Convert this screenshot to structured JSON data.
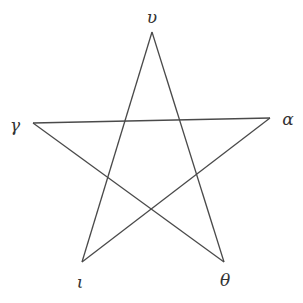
{
  "diagram": {
    "type": "pentagram",
    "nodes": [
      {
        "id": "upsilon",
        "label": "υ",
        "x": 152,
        "y": 32,
        "lx": 152,
        "ly": 23
      },
      {
        "id": "gamma",
        "label": "γ",
        "x": 33,
        "y": 123,
        "lx": 15,
        "ly": 131
      },
      {
        "id": "alpha",
        "label": "α",
        "x": 270,
        "y": 118,
        "lx": 288,
        "ly": 125
      },
      {
        "id": "iota",
        "label": "ι",
        "x": 82,
        "y": 262,
        "lx": 80,
        "ly": 288
      },
      {
        "id": "theta",
        "label": "θ",
        "x": 224,
        "y": 262,
        "lx": 225,
        "ly": 286
      }
    ],
    "edges": [
      [
        "upsilon",
        "iota"
      ],
      [
        "upsilon",
        "theta"
      ],
      [
        "gamma",
        "alpha"
      ],
      [
        "gamma",
        "theta"
      ],
      [
        "alpha",
        "iota"
      ]
    ],
    "colors": {
      "line": "#4a4a4a",
      "text": "#333333",
      "background": "#ffffff"
    }
  }
}
